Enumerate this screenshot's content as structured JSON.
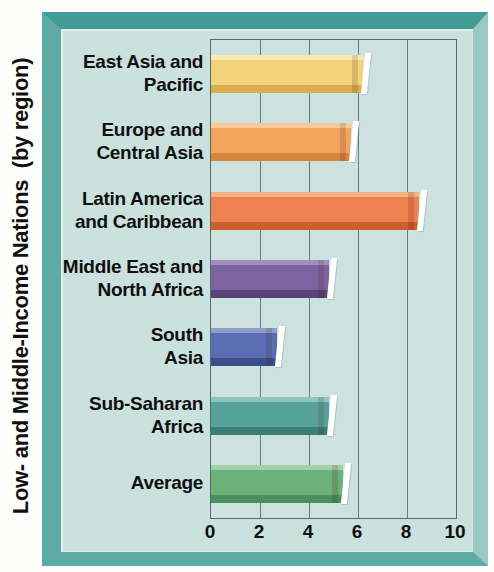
{
  "y_axis_title": "Low- and Middle-Income Nations  (by region)",
  "chart_data": {
    "type": "bar",
    "orientation": "horizontal",
    "title": "",
    "xlabel": "",
    "ylabel": "Low- and Middle-Income Nations (by region)",
    "xlim": [
      0,
      10
    ],
    "x_ticks": [
      "0",
      "2",
      "4",
      "6",
      "8",
      "10"
    ],
    "x_tick_values": [
      0,
      2,
      4,
      6,
      8,
      10
    ],
    "gridlines_x": [
      2,
      4,
      6,
      8
    ],
    "grid": "on",
    "legend": "none",
    "categories": [
      "East Asia and Pacific",
      "Europe and Central Asia",
      "Latin America and Caribbean",
      "Middle East and North Africa",
      "South Asia",
      "Sub-Saharan Africa",
      "Average"
    ],
    "category_label_lines": [
      [
        "East Asia and",
        "Pacific"
      ],
      [
        "Europe and",
        "Central Asia"
      ],
      [
        "Latin America",
        "and Caribbean"
      ],
      [
        "Middle East and",
        "North Africa"
      ],
      [
        "South",
        "Asia"
      ],
      [
        "Sub-Saharan",
        "Africa"
      ],
      [
        "Average"
      ]
    ],
    "values": [
      6.2,
      5.7,
      8.5,
      4.8,
      2.7,
      4.8,
      5.4
    ],
    "bar_colors": [
      {
        "top": "#f9eab0",
        "face": "#f2d37c",
        "bottom": "#d9ad52"
      },
      {
        "top": "#f8cc98",
        "face": "#f2a55f",
        "bottom": "#d8833b"
      },
      {
        "top": "#f5af85",
        "face": "#ee8150",
        "bottom": "#cb5e2b"
      },
      {
        "top": "#a28fbf",
        "face": "#7d63a0",
        "bottom": "#594377"
      },
      {
        "top": "#8e9ccc",
        "face": "#5a6db2",
        "bottom": "#3d4e8d"
      },
      {
        "top": "#90c5be",
        "face": "#57a39b",
        "bottom": "#3b7e75"
      },
      {
        "top": "#a3cfa9",
        "face": "#6cb07a",
        "bottom": "#4c8f5e"
      }
    ],
    "style_colors": {
      "frame_teal": "#4aa49c",
      "panel": "#cbe1dd",
      "grid_line": "#4f6e6b",
      "text": "#101010"
    }
  }
}
